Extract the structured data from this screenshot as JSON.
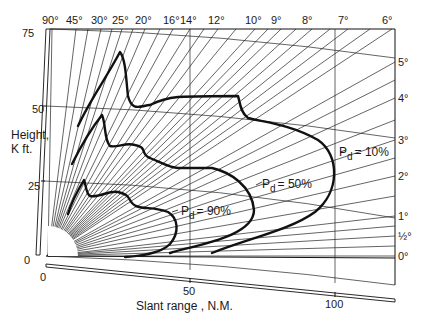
{
  "chart_data": {
    "type": "line",
    "title": "",
    "xlabel": "Slant range, NM.",
    "ylabel": "Height, K ft.",
    "x_ticks": [
      "0",
      "50",
      "100"
    ],
    "y_ticks": [
      "0",
      "25",
      "50",
      "75"
    ],
    "xlim": [
      0,
      120
    ],
    "ylim": [
      0,
      75
    ],
    "grid": true,
    "elevation_angle_labels_top": [
      "90°",
      "45°",
      "30°",
      "25°",
      "20°",
      "16°",
      "14°",
      "12°",
      "10°",
      "9°",
      "8°",
      "7°",
      "6°"
    ],
    "elevation_angle_labels_right": [
      "5°",
      "4°",
      "3°",
      "2°",
      "1°",
      "½°",
      "0°"
    ],
    "series": [
      {
        "name": "Pd = 90%",
        "label": "P_d = 90%",
        "points_range_nm_height_kft": [
          [
            8,
            20
          ],
          [
            12,
            27
          ],
          [
            14,
            28
          ],
          [
            16,
            22
          ],
          [
            22,
            22
          ],
          [
            30,
            22
          ],
          [
            35,
            20
          ],
          [
            38,
            16
          ],
          [
            38,
            12
          ],
          [
            34,
            6
          ],
          [
            25,
            1
          ]
        ]
      },
      {
        "name": "Pd = 50%",
        "label": "P_d = 50%",
        "points_range_nm_height_kft": [
          [
            8,
            30
          ],
          [
            14,
            45
          ],
          [
            17,
            48
          ],
          [
            20,
            38
          ],
          [
            26,
            37
          ],
          [
            34,
            38
          ],
          [
            40,
            37
          ],
          [
            50,
            32
          ],
          [
            60,
            28
          ],
          [
            66,
            20
          ],
          [
            64,
            12
          ],
          [
            55,
            5
          ],
          [
            42,
            1
          ]
        ]
      },
      {
        "name": "Pd = 10%",
        "label": "P_d = 10%",
        "points_range_nm_height_kft": [
          [
            10,
            40
          ],
          [
            18,
            62
          ],
          [
            21,
            68
          ],
          [
            24,
            50
          ],
          [
            30,
            46
          ],
          [
            40,
            49
          ],
          [
            50,
            47
          ],
          [
            62,
            47
          ],
          [
            66,
            40
          ],
          [
            80,
            36
          ],
          [
            92,
            30
          ],
          [
            100,
            22
          ],
          [
            96,
            12
          ],
          [
            80,
            5
          ],
          [
            60,
            1
          ]
        ]
      }
    ],
    "annotations": [
      {
        "text": "P_d = 90%",
        "attached_to": "Pd = 90%"
      },
      {
        "text": "P_d = 50%",
        "attached_to": "Pd = 50%"
      },
      {
        "text": "P_d = 10%",
        "attached_to": "Pd = 10%"
      }
    ]
  },
  "labels": {
    "y_axis_title_line1": "Height,",
    "y_axis_title_line2": "K ft.",
    "x_axis_title": "Slant range , N.M.",
    "y0": "0",
    "y25": "25",
    "y50": "50",
    "y75": "75",
    "x0": "0",
    "x50": "50",
    "x100": "100",
    "top": [
      "90°",
      "45°",
      "30°",
      "25°",
      "20°",
      "16°",
      "14°",
      "12°",
      "10°",
      "9°",
      "8°",
      "7°",
      "6°"
    ],
    "right": [
      "5°",
      "4°",
      "3°",
      "2°",
      "1°",
      "½°",
      "0°"
    ],
    "pd_prefix": "P",
    "pd_sub": "d",
    "pd90": "= 90%",
    "pd50": "= 50%",
    "pd10": "= 10%"
  }
}
